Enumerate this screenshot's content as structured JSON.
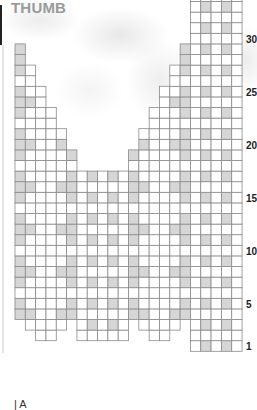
{
  "title": "THUMB",
  "bottom_label": "| A",
  "colors": {
    "grid_line": "#8a8a8a",
    "cell_fill": "#ffffff",
    "shaded_fill": "#d6d6d6",
    "title": "#9a9a9a",
    "label": "#222222"
  },
  "chart_data": {
    "type": "table",
    "columns": 22,
    "rows_visible": 34,
    "row_labels": [
      {
        "row": 1,
        "text": "1"
      },
      {
        "row": 5,
        "text": "5"
      },
      {
        "row": 10,
        "text": "10"
      },
      {
        "row": 15,
        "text": "15"
      },
      {
        "row": 20,
        "text": "20"
      },
      {
        "row": 25,
        "text": "25"
      },
      {
        "row": 30,
        "text": "30"
      }
    ],
    "column_extents": [
      {
        "col": 0,
        "from_row": 4,
        "to_row": 29
      },
      {
        "col": 1,
        "from_row": 3,
        "to_row": 27
      },
      {
        "col": 2,
        "from_row": 2,
        "to_row": 25
      },
      {
        "col": 3,
        "from_row": 2,
        "to_row": 23
      },
      {
        "col": 4,
        "from_row": 3,
        "to_row": 21
      },
      {
        "col": 5,
        "from_row": 4,
        "to_row": 19
      },
      {
        "col": 6,
        "from_row": 2,
        "to_row": 17
      },
      {
        "col": 7,
        "from_row": 2,
        "to_row": 17
      },
      {
        "col": 8,
        "from_row": 2,
        "to_row": 17
      },
      {
        "col": 9,
        "from_row": 2,
        "to_row": 17
      },
      {
        "col": 10,
        "from_row": 2,
        "to_row": 17
      },
      {
        "col": 11,
        "from_row": 4,
        "to_row": 19
      },
      {
        "col": 12,
        "from_row": 3,
        "to_row": 21
      },
      {
        "col": 13,
        "from_row": 2,
        "to_row": 23
      },
      {
        "col": 14,
        "from_row": 2,
        "to_row": 25
      },
      {
        "col": 15,
        "from_row": 3,
        "to_row": 27
      },
      {
        "col": 16,
        "from_row": 4,
        "to_row": 29
      },
      {
        "col": 17,
        "from_row": 1,
        "to_row": 34
      },
      {
        "col": 18,
        "from_row": 1,
        "to_row": 34
      },
      {
        "col": 19,
        "from_row": 1,
        "to_row": 34
      },
      {
        "col": 20,
        "from_row": 1,
        "to_row": 34
      },
      {
        "col": 21,
        "from_row": 1,
        "to_row": 34
      }
    ],
    "shading_rules": {
      "odd_rows": [
        0,
        5,
        7,
        9,
        11,
        16,
        18,
        20
      ],
      "rows_multiple_of_4": [
        0,
        1,
        4,
        5,
        11,
        12,
        15,
        16
      ],
      "rows_2_mod_4": []
    }
  }
}
